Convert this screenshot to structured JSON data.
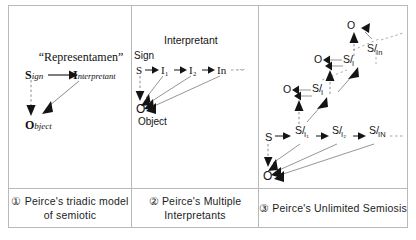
{
  "figure": {
    "background": "#ffffff",
    "border_color": "#b9b9b9",
    "ink_color": "#141414"
  },
  "panels": [
    {
      "id": "panel-1",
      "caption": "① Peirce's triadic model of semiotic",
      "title": "“Representamen”",
      "nodes": {
        "sign_cap": "S",
        "sign_rest": "ign",
        "interpretant_cap": "I",
        "interpretant_rest": "nterpretant",
        "object_cap": "O",
        "object_rest": "bject"
      },
      "edges": [
        {
          "from": "Sign",
          "to": "Interpretant",
          "style": "solid"
        },
        {
          "from": "Sign",
          "to": "Object",
          "style": "dashed"
        },
        {
          "from": "Interpretant",
          "to": "Object",
          "style": "solid"
        }
      ]
    },
    {
      "id": "panel-2",
      "caption": "② Peirce's Multiple Interpretants",
      "label_interpretant": "Interpretant",
      "label_sign": "Sign",
      "label_object": "Object",
      "chain": [
        "S",
        "I₁",
        "I₂",
        "In"
      ],
      "chain_continues": "···",
      "object_node": "O",
      "edges": [
        {
          "from": "S",
          "to": "O",
          "style": "dashed"
        },
        {
          "from": "I₁",
          "to": "O",
          "style": "solid"
        },
        {
          "from": "I₂",
          "to": "O",
          "style": "solid"
        },
        {
          "from": "In",
          "to": "O",
          "style": "solid"
        }
      ]
    },
    {
      "id": "panel-3",
      "caption": "③ Peirce's Unlimited Semiosis",
      "base_chain": [
        "S",
        "S/I₁",
        "S/I₂",
        "S/Iₔ"
      ],
      "object_node": "O",
      "upper_objects": [
        "O",
        "O",
        "O"
      ],
      "upper_signs": [
        "S/I",
        "S/I",
        "S/Iₙ"
      ],
      "continues": true
    }
  ],
  "glyphs": {
    "S": "S",
    "O": "O",
    "I": "I",
    "slash": "/",
    "sub_1": "₁",
    "sub_2": "₂",
    "sub_N": "N",
    "sub_n": "n",
    "dots": "···"
  }
}
